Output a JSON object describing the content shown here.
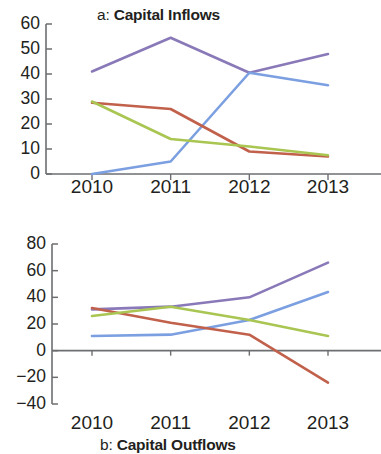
{
  "figure": {
    "background": "#ffffff",
    "axis_color": "#6d6e71",
    "text_color": "#231f20"
  },
  "panels": [
    {
      "id": "a",
      "title_prefix": "a:",
      "title_name": "Capital Inflows"
    },
    {
      "id": "b",
      "title_prefix": "b:",
      "title_name": "Capital Outflows"
    }
  ],
  "chart_data": [
    {
      "type": "line",
      "title": "a: Capital Inflows",
      "panel_label": "a",
      "xlabel": "",
      "ylabel": "",
      "x": [
        "2010",
        "2011",
        "2012",
        "2013"
      ],
      "categories": [
        "2010",
        "2011",
        "2012",
        "2013"
      ],
      "xtick_labels": [
        "2010",
        "2011",
        "2012",
        "2013"
      ],
      "ytick_labels": [
        "0",
        "10",
        "20",
        "30",
        "40",
        "50",
        "60"
      ],
      "yticks": [
        0,
        10,
        20,
        30,
        40,
        50,
        60
      ],
      "ylim": [
        0,
        60
      ],
      "grid": false,
      "legend": "none",
      "series": [
        {
          "name": "purple",
          "color": "#8a79b8",
          "values": [
            41,
            54.5,
            40.5,
            48
          ]
        },
        {
          "name": "blue",
          "color": "#7b9fe0",
          "values": [
            0,
            5,
            40.5,
            35.5
          ]
        },
        {
          "name": "red",
          "color": "#c1604b",
          "values": [
            28.5,
            26,
            9,
            7
          ]
        },
        {
          "name": "green",
          "color": "#a9c552",
          "values": [
            29,
            14,
            11,
            7.5
          ]
        }
      ]
    },
    {
      "type": "line",
      "title": "b: Capital Outflows",
      "panel_label": "b",
      "xlabel": "",
      "ylabel": "",
      "x": [
        "2010",
        "2011",
        "2012",
        "2013"
      ],
      "categories": [
        "2010",
        "2011",
        "2012",
        "2013"
      ],
      "xtick_labels": [
        "2010",
        "2011",
        "2012",
        "2013"
      ],
      "ytick_labels": [
        "−40",
        "−20",
        "0",
        "20",
        "40",
        "60",
        "80"
      ],
      "yticks": [
        -40,
        -20,
        0,
        20,
        40,
        60,
        80
      ],
      "ylim": [
        -40,
        80
      ],
      "grid": false,
      "zero_line": true,
      "legend": "none",
      "series": [
        {
          "name": "purple",
          "color": "#8a79b8",
          "values": [
            31,
            33,
            40,
            66
          ]
        },
        {
          "name": "blue",
          "color": "#7b9fe0",
          "values": [
            11,
            12,
            23,
            44
          ]
        },
        {
          "name": "red",
          "color": "#c1604b",
          "values": [
            32,
            21,
            12,
            -24
          ]
        },
        {
          "name": "green",
          "color": "#a9c552",
          "values": [
            26,
            33,
            23,
            11
          ]
        }
      ]
    }
  ]
}
